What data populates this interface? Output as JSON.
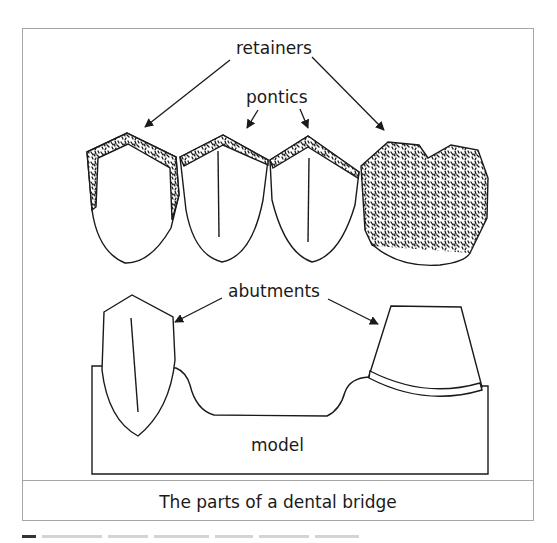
{
  "figure": {
    "labels": {
      "retainers": "retainers",
      "pontics": "pontics",
      "abutments": "abutments",
      "model": "model"
    },
    "caption": "The parts of a dental bridge",
    "colors": {
      "frame": "#a6a6a6",
      "ink": "#1a1a1a",
      "background": "#ffffff"
    }
  }
}
